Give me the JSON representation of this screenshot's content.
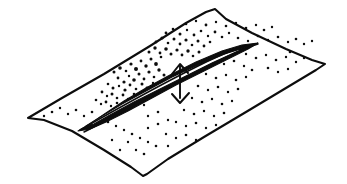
{
  "figure": {
    "title": "Hand-drawn diagram of a fissure in a speckled planar sheet with a vertical double-headed displacement arrow",
    "caption": "",
    "background_color": "#ffffff",
    "ink_color": "#0d0d0d",
    "canvas": {
      "width": 347,
      "height": 184
    }
  },
  "sheet": {
    "name": "ground-sheet",
    "description": "Quadrilateral sheet drawn in oblique perspective with slightly wavy hand-drawn edges",
    "corners": {
      "left": [
        28,
        118
      ],
      "top": [
        215,
        9
      ],
      "right": [
        325,
        64
      ],
      "bottom": [
        143,
        176
      ]
    },
    "outline_path": "M28,118 L62,98 L104,74 L150,46 L186,23 L206,12 L215,9 L226,19 L252,33 L286,49 L312,60 L325,64 L316,70 L286,88 L246,112 L204,137 L168,159 L147,174 L143,176 L131,167 L104,150 L72,131 L44,120 Z",
    "stroke_width": 2.1
  },
  "fissure": {
    "name": "fissure-crack",
    "description": "Elongated lens / eye shaped crack running from lower-left to upper-right along the sheet",
    "left_tip": [
      78,
      131
    ],
    "right_tip": [
      258,
      43
    ],
    "outer_path": "M78,131 L90,124 L106,113 L124,101 L146,88 L170,75 L196,62 L222,51 L242,45 L258,43 L248,49 L226,60 L202,72 L176,85 L152,98 L128,111 L106,122 L90,129 Z",
    "inner_path": "M86,126 L102,116 L122,104 L146,91 L172,77 L198,65 L224,54 L244,48 L252,45 L236,52 L212,63 L186,76 L160,89 L134,102 L110,115 L94,124 Z",
    "rib_paths": [
      "M80,130 C108,114 150,90 198,66 C224,53 244,46 256,44",
      "M84,132 C114,117 156,92 204,68 C230,55 248,47 258,44"
    ]
  },
  "arrow": {
    "name": "displacement-arrow",
    "description": "Vertical double-headed arrow; upward head sits on the fissure line, downward head below the sheet surface",
    "orientation": "vertical",
    "shaft": {
      "x": 180,
      "y_top": 66,
      "y_bottom": 98
    },
    "head_up": {
      "tip": [
        180,
        64
      ],
      "left_barb": [
        172,
        74
      ],
      "right_barb": [
        188,
        73
      ]
    },
    "head_down": {
      "tip": [
        180,
        103
      ],
      "left_barb": [
        172,
        94
      ],
      "right_barb": [
        189,
        93
      ]
    },
    "label": ""
  },
  "speckles": {
    "name": "ejecta-speckles",
    "description": "Scattered ink specks representing debris, densest just above and left of the fissure",
    "count": 168,
    "dense_cluster_center": [
      148,
      66
    ],
    "points": [
      [
        114,
        72,
        1.5
      ],
      [
        120,
        68,
        1.8
      ],
      [
        126,
        71,
        1.3
      ],
      [
        131,
        64,
        1.6
      ],
      [
        136,
        69,
        2.0
      ],
      [
        141,
        61,
        1.4
      ],
      [
        146,
        66,
        1.7
      ],
      [
        151,
        59,
        1.5
      ],
      [
        156,
        64,
        1.9
      ],
      [
        161,
        57,
        1.3
      ],
      [
        118,
        78,
        1.4
      ],
      [
        124,
        82,
        1.6
      ],
      [
        129,
        76,
        1.2
      ],
      [
        134,
        80,
        1.8
      ],
      [
        139,
        74,
        1.5
      ],
      [
        144,
        79,
        1.4
      ],
      [
        149,
        72,
        1.6
      ],
      [
        154,
        77,
        1.3
      ],
      [
        159,
        70,
        1.7
      ],
      [
        164,
        75,
        1.5
      ],
      [
        108,
        84,
        1.3
      ],
      [
        113,
        88,
        1.5
      ],
      [
        119,
        86,
        1.2
      ],
      [
        125,
        90,
        1.6
      ],
      [
        130,
        85,
        1.4
      ],
      [
        136,
        89,
        1.3
      ],
      [
        142,
        84,
        1.5
      ],
      [
        147,
        88,
        1.4
      ],
      [
        153,
        83,
        1.2
      ],
      [
        158,
        87,
        1.6
      ],
      [
        102,
        92,
        1.4
      ],
      [
        107,
        96,
        1.2
      ],
      [
        112,
        94,
        1.5
      ],
      [
        117,
        98,
        1.3
      ],
      [
        123,
        95,
        1.4
      ],
      [
        128,
        99,
        1.2
      ],
      [
        134,
        94,
        1.3
      ],
      [
        139,
        98,
        1.5
      ],
      [
        145,
        93,
        1.2
      ],
      [
        150,
        97,
        1.3
      ],
      [
        96,
        100,
        1.3
      ],
      [
        101,
        104,
        1.2
      ],
      [
        106,
        102,
        1.4
      ],
      [
        111,
        106,
        1.2
      ],
      [
        117,
        103,
        1.3
      ],
      [
        122,
        107,
        1.2
      ],
      [
        128,
        102,
        1.4
      ],
      [
        133,
        106,
        1.2
      ],
      [
        139,
        101,
        1.3
      ],
      [
        144,
        105,
        1.2
      ],
      [
        149,
        52,
        1.5
      ],
      [
        155,
        48,
        1.7
      ],
      [
        160,
        53,
        1.4
      ],
      [
        166,
        49,
        1.8
      ],
      [
        171,
        54,
        1.5
      ],
      [
        177,
        50,
        1.6
      ],
      [
        182,
        55,
        1.4
      ],
      [
        188,
        51,
        1.7
      ],
      [
        193,
        56,
        1.3
      ],
      [
        199,
        52,
        1.5
      ],
      [
        156,
        42,
        1.4
      ],
      [
        162,
        38,
        1.6
      ],
      [
        168,
        43,
        1.3
      ],
      [
        174,
        39,
        1.5
      ],
      [
        180,
        44,
        1.4
      ],
      [
        186,
        40,
        1.6
      ],
      [
        192,
        45,
        1.3
      ],
      [
        198,
        41,
        1.5
      ],
      [
        204,
        46,
        1.4
      ],
      [
        210,
        42,
        1.3
      ],
      [
        166,
        33,
        1.4
      ],
      [
        173,
        29,
        1.3
      ],
      [
        180,
        34,
        1.5
      ],
      [
        187,
        30,
        1.2
      ],
      [
        194,
        35,
        1.4
      ],
      [
        201,
        31,
        1.3
      ],
      [
        208,
        36,
        1.2
      ],
      [
        215,
        32,
        1.4
      ],
      [
        222,
        37,
        1.3
      ],
      [
        229,
        33,
        1.2
      ],
      [
        186,
        24,
        1.3
      ],
      [
        196,
        21,
        1.2
      ],
      [
        206,
        25,
        1.4
      ],
      [
        216,
        22,
        1.2
      ],
      [
        226,
        26,
        1.3
      ],
      [
        236,
        23,
        1.2
      ],
      [
        246,
        28,
        1.3
      ],
      [
        256,
        25,
        1.2
      ],
      [
        264,
        30,
        1.3
      ],
      [
        272,
        27,
        1.2
      ],
      [
        238,
        38,
        1.3
      ],
      [
        248,
        41,
        1.2
      ],
      [
        258,
        36,
        1.3
      ],
      [
        268,
        40,
        1.2
      ],
      [
        278,
        37,
        1.3
      ],
      [
        288,
        42,
        1.2
      ],
      [
        296,
        39,
        1.3
      ],
      [
        304,
        44,
        1.2
      ],
      [
        312,
        41,
        1.2
      ],
      [
        290,
        52,
        1.3
      ],
      [
        246,
        54,
        1.2
      ],
      [
        256,
        58,
        1.3
      ],
      [
        266,
        55,
        1.2
      ],
      [
        276,
        60,
        1.3
      ],
      [
        286,
        57,
        1.2
      ],
      [
        296,
        62,
        1.2
      ],
      [
        304,
        58,
        1.2
      ],
      [
        268,
        68,
        1.3
      ],
      [
        278,
        72,
        1.2
      ],
      [
        288,
        69,
        1.2
      ],
      [
        214,
        60,
        1.3
      ],
      [
        224,
        64,
        1.2
      ],
      [
        234,
        61,
        1.3
      ],
      [
        244,
        66,
        1.2
      ],
      [
        252,
        70,
        1.3
      ],
      [
        206,
        74,
        1.2
      ],
      [
        216,
        78,
        1.3
      ],
      [
        226,
        75,
        1.2
      ],
      [
        236,
        80,
        1.3
      ],
      [
        246,
        77,
        1.2
      ],
      [
        198,
        86,
        1.3
      ],
      [
        208,
        90,
        1.2
      ],
      [
        218,
        87,
        1.3
      ],
      [
        228,
        92,
        1.2
      ],
      [
        238,
        89,
        1.3
      ],
      [
        192,
        98,
        1.2
      ],
      [
        202,
        102,
        1.3
      ],
      [
        212,
        99,
        1.2
      ],
      [
        222,
        104,
        1.3
      ],
      [
        232,
        101,
        1.2
      ],
      [
        184,
        110,
        1.2
      ],
      [
        194,
        114,
        1.3
      ],
      [
        204,
        111,
        1.2
      ],
      [
        214,
        116,
        1.2
      ],
      [
        224,
        113,
        1.3
      ],
      [
        176,
        122,
        1.2
      ],
      [
        186,
        126,
        1.2
      ],
      [
        196,
        123,
        1.3
      ],
      [
        206,
        128,
        1.2
      ],
      [
        216,
        125,
        1.2
      ],
      [
        166,
        134,
        1.2
      ],
      [
        176,
        138,
        1.2
      ],
      [
        186,
        135,
        1.3
      ],
      [
        196,
        140,
        1.2
      ],
      [
        168,
        146,
        1.2
      ],
      [
        92,
        112,
        1.3
      ],
      [
        84,
        116,
        1.2
      ],
      [
        76,
        110,
        1.3
      ],
      [
        68,
        114,
        1.2
      ],
      [
        60,
        108,
        1.2
      ],
      [
        52,
        112,
        1.3
      ],
      [
        44,
        116,
        1.2
      ],
      [
        100,
        118,
        1.2
      ],
      [
        108,
        122,
        1.3
      ],
      [
        116,
        126,
        1.2
      ],
      [
        124,
        130,
        1.2
      ],
      [
        132,
        134,
        1.3
      ],
      [
        140,
        138,
        1.2
      ],
      [
        148,
        142,
        1.2
      ],
      [
        156,
        146,
        1.3
      ],
      [
        128,
        142,
        1.2
      ],
      [
        136,
        150,
        1.2
      ],
      [
        144,
        154,
        1.3
      ],
      [
        120,
        150,
        1.2
      ],
      [
        112,
        140,
        1.2
      ],
      [
        148,
        128,
        1.2
      ],
      [
        158,
        124,
        1.3
      ],
      [
        168,
        120,
        1.2
      ],
      [
        158,
        112,
        1.3
      ],
      [
        148,
        116,
        1.2
      ]
    ]
  }
}
